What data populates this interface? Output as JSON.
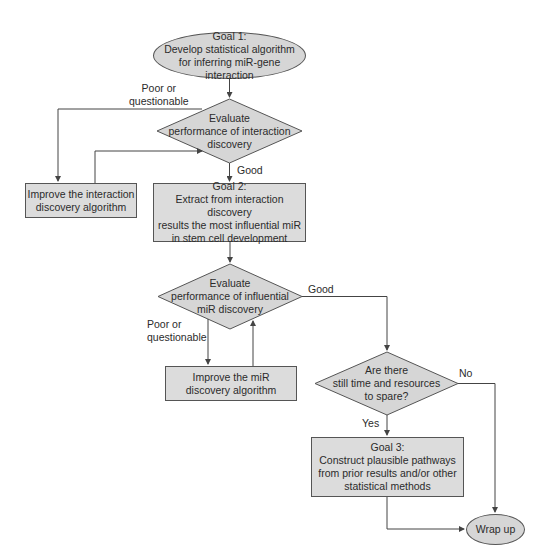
{
  "nodes": {
    "goal1": {
      "text": "Goal 1:\nDevelop statistical algorithm\nfor inferring miR-gene\ninteraction"
    },
    "eval1": {
      "text": "Evaluate\nperformance of interaction\ndiscovery"
    },
    "improve1": {
      "text": "Improve the interaction\ndiscovery algorithm"
    },
    "goal2": {
      "text": "Goal 2:\nExtract from interaction discovery\nresults the most influential miR\nin stem cell development"
    },
    "eval2": {
      "text": "Evaluate\nperformance of influential\nmiR discovery"
    },
    "improve2": {
      "text": "Improve the miR\ndiscovery algorithm"
    },
    "eval3": {
      "text": "Are there\nstill time and resources\nto spare?"
    },
    "goal3": {
      "text": "Goal 3:\nConstruct plausible pathways\nfrom prior results and/or other\nstatistical methods"
    },
    "wrapup": {
      "text": "Wrap up"
    }
  },
  "edge_labels": {
    "eval1_poor": "Poor or\nquestionable",
    "eval1_good": "Good",
    "eval2_good": "Good",
    "eval2_poor": "Poor or\nquestionable",
    "eval3_no": "No",
    "eval3_yes": "Yes"
  },
  "colors": {
    "fill": "#dcdcdc",
    "stroke": "#555555",
    "text": "#2b2b2b"
  }
}
